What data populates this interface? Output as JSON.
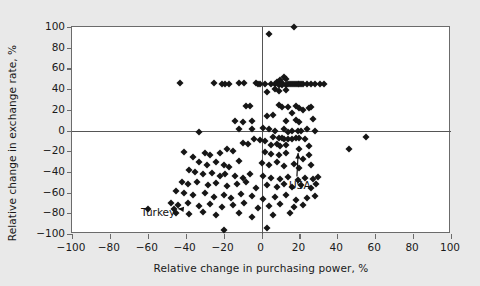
{
  "chart_data": {
    "type": "scatter",
    "title": "",
    "xlabel": "Relative change in purchasing power, %",
    "ylabel": "Relative change in exchange rate, %",
    "xlim": [
      -100,
      100
    ],
    "ylim": [
      -100,
      100
    ],
    "xticks": [
      -100,
      -80,
      -60,
      -40,
      -20,
      0,
      20,
      40,
      60,
      80,
      100
    ],
    "yticks": [
      -100,
      -80,
      -60,
      -40,
      -20,
      0,
      20,
      40,
      60,
      80,
      100
    ],
    "xtick_labels": [
      "-100",
      "-80",
      "-60",
      "-40",
      "-20",
      "0",
      "20",
      "40",
      "60",
      "80",
      "100"
    ],
    "ytick_labels": [
      "-100",
      "-80",
      "-60",
      "-40",
      "-20",
      "0",
      "20",
      "40",
      "60",
      "80",
      "100"
    ],
    "grid": false,
    "legend": null,
    "reference_lines": [
      {
        "axis": "x",
        "value": 0
      },
      {
        "axis": "y",
        "value": 0
      }
    ],
    "marker": "diamond",
    "marker_color": "#161616",
    "annotations": [
      {
        "label": "Turkey",
        "label_x": -63,
        "label_y": -81,
        "point_x": -46,
        "point_y": -76
      },
      {
        "label": "USA",
        "label_x": 15,
        "label_y": -55,
        "point_x": 20,
        "point_y": -18
      }
    ],
    "points": [
      [
        17,
        100
      ],
      [
        4,
        93
      ],
      [
        8,
        47
      ],
      [
        10,
        49
      ],
      [
        11,
        46
      ],
      [
        12,
        52
      ],
      [
        13,
        50
      ],
      [
        -43,
        46
      ],
      [
        -25,
        46
      ],
      [
        -21,
        45
      ],
      [
        -19,
        45
      ],
      [
        -17,
        45
      ],
      [
        -12,
        46
      ],
      [
        -9,
        46
      ],
      [
        -3,
        46
      ],
      [
        -2,
        45
      ],
      [
        -1,
        45
      ],
      [
        2,
        45
      ],
      [
        5,
        45
      ],
      [
        7,
        45
      ],
      [
        9,
        44
      ],
      [
        11,
        44
      ],
      [
        13,
        44
      ],
      [
        14,
        45
      ],
      [
        15,
        45
      ],
      [
        16,
        45
      ],
      [
        17,
        45
      ],
      [
        18,
        45
      ],
      [
        19,
        45
      ],
      [
        20,
        45
      ],
      [
        21,
        45
      ],
      [
        22,
        45
      ],
      [
        24,
        45
      ],
      [
        26,
        45
      ],
      [
        28,
        45
      ],
      [
        31,
        45
      ],
      [
        33,
        45
      ],
      [
        7,
        40
      ],
      [
        9,
        38
      ],
      [
        13,
        39
      ],
      [
        3,
        37
      ],
      [
        -8,
        24
      ],
      [
        -6,
        24
      ],
      [
        9,
        25
      ],
      [
        11,
        23
      ],
      [
        14,
        23
      ],
      [
        18,
        24
      ],
      [
        20,
        22
      ],
      [
        16,
        17
      ],
      [
        22,
        20
      ],
      [
        25,
        22
      ],
      [
        26,
        23
      ],
      [
        3,
        14
      ],
      [
        6,
        15
      ],
      [
        -14,
        9
      ],
      [
        -10,
        8
      ],
      [
        -5,
        9
      ],
      [
        13,
        9
      ],
      [
        18,
        10
      ],
      [
        20,
        8
      ],
      [
        27,
        11
      ],
      [
        -33,
        -1
      ],
      [
        -12,
        1
      ],
      [
        -5,
        1
      ],
      [
        1,
        2
      ],
      [
        4,
        1
      ],
      [
        7,
        0
      ],
      [
        12,
        1
      ],
      [
        14,
        -1
      ],
      [
        16,
        0
      ],
      [
        19,
        0
      ],
      [
        21,
        0
      ],
      [
        24,
        1
      ],
      [
        28,
        0
      ],
      [
        46,
        -18
      ],
      [
        55,
        -6
      ],
      [
        6,
        -6
      ],
      [
        9,
        -7
      ],
      [
        11,
        -7
      ],
      [
        12,
        -8
      ],
      [
        14,
        -8
      ],
      [
        16,
        -8
      ],
      [
        18,
        -7
      ],
      [
        20,
        -7
      ],
      [
        23,
        -8
      ],
      [
        -4,
        -8
      ],
      [
        -1,
        -9
      ],
      [
        2,
        -10
      ],
      [
        -10,
        -12
      ],
      [
        -7,
        -13
      ],
      [
        5,
        -14
      ],
      [
        8,
        -13
      ],
      [
        10,
        -15
      ],
      [
        13,
        -14
      ],
      [
        20,
        -18
      ],
      [
        25,
        -15
      ],
      [
        -18,
        -18
      ],
      [
        -15,
        -20
      ],
      [
        -22,
        -22
      ],
      [
        -27,
        -24
      ],
      [
        -30,
        -22
      ],
      [
        -36,
        -26
      ],
      [
        -41,
        -21
      ],
      [
        2,
        -21
      ],
      [
        5,
        -23
      ],
      [
        9,
        -24
      ],
      [
        13,
        -22
      ],
      [
        22,
        -28
      ],
      [
        25,
        -24
      ],
      [
        -33,
        -30
      ],
      [
        -29,
        -33
      ],
      [
        -24,
        -30
      ],
      [
        -20,
        -33
      ],
      [
        -17,
        -35
      ],
      [
        -12,
        -29
      ],
      [
        0,
        -31
      ],
      [
        4,
        -33
      ],
      [
        8,
        -30
      ],
      [
        12,
        -34
      ],
      [
        17,
        -32
      ],
      [
        20,
        -36
      ],
      [
        26,
        -33
      ],
      [
        -38,
        -38
      ],
      [
        -35,
        -40
      ],
      [
        -31,
        -42
      ],
      [
        -26,
        -41
      ],
      [
        -22,
        -44
      ],
      [
        -19,
        -42
      ],
      [
        -14,
        -44
      ],
      [
        -10,
        -46
      ],
      [
        -6,
        -42
      ],
      [
        1,
        -44
      ],
      [
        5,
        -46
      ],
      [
        10,
        -47
      ],
      [
        14,
        -45
      ],
      [
        19,
        -48
      ],
      [
        23,
        -46
      ],
      [
        27,
        -47
      ],
      [
        30,
        -45
      ],
      [
        -42,
        -50
      ],
      [
        -39,
        -52
      ],
      [
        -34,
        -50
      ],
      [
        -28,
        -53
      ],
      [
        -24,
        -51
      ],
      [
        -18,
        -54
      ],
      [
        -13,
        -52
      ],
      [
        -8,
        -50
      ],
      [
        -3,
        -56
      ],
      [
        3,
        -53
      ],
      [
        8,
        -55
      ],
      [
        12,
        -52
      ],
      [
        16,
        -55
      ],
      [
        21,
        -53
      ],
      [
        26,
        -56
      ],
      [
        29,
        -52
      ],
      [
        -45,
        -58
      ],
      [
        -41,
        -60
      ],
      [
        -36,
        -62
      ],
      [
        -30,
        -60
      ],
      [
        -25,
        -64
      ],
      [
        -20,
        -62
      ],
      [
        -16,
        -65
      ],
      [
        -11,
        -61
      ],
      [
        -5,
        -63
      ],
      [
        1,
        -66
      ],
      [
        7,
        -64
      ],
      [
        13,
        -62
      ],
      [
        18,
        -67
      ],
      [
        24,
        -65
      ],
      [
        28,
        -63
      ],
      [
        -48,
        -70
      ],
      [
        -44,
        -72
      ],
      [
        -39,
        -70
      ],
      [
        -33,
        -73
      ],
      [
        -27,
        -71
      ],
      [
        -21,
        -74
      ],
      [
        -15,
        -72
      ],
      [
        -9,
        -70
      ],
      [
        -2,
        -75
      ],
      [
        4,
        -73
      ],
      [
        10,
        -71
      ],
      [
        17,
        -74
      ],
      [
        22,
        -72
      ],
      [
        -60,
        -76
      ],
      [
        -46,
        -76
      ],
      [
        -45,
        -80
      ],
      [
        -38,
        -81
      ],
      [
        -31,
        -79
      ],
      [
        -24,
        -82
      ],
      [
        -12,
        -80
      ],
      [
        -5,
        -84
      ],
      [
        6,
        -82
      ],
      [
        15,
        -80
      ],
      [
        -20,
        -96
      ],
      [
        3,
        -94
      ]
    ]
  }
}
